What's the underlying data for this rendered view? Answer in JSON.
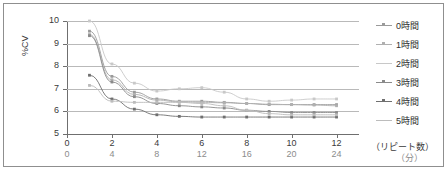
{
  "axes": {
    "ylabel": "%CV",
    "yticks": [
      "10",
      "9",
      "8",
      "7",
      "6",
      "5"
    ],
    "xticks_top": [
      "0",
      "2",
      "4",
      "6",
      "8",
      "10",
      "12"
    ],
    "xticks_bottom": [
      "0",
      "4",
      "8",
      "12",
      "16",
      "20",
      "24"
    ],
    "xunit_top": "（リピート数）",
    "xunit_bottom": "（分）"
  },
  "legend": {
    "items": [
      {
        "label": "0時間",
        "color": "#9a9a9a",
        "marker": "square"
      },
      {
        "label": "1時間",
        "color": "#b0b0b0",
        "marker": "square"
      },
      {
        "label": "2時間",
        "color": "#c8c8c8",
        "marker": "none"
      },
      {
        "label": "3時間",
        "color": "#8a8a8a",
        "marker": "square"
      },
      {
        "label": "4時間",
        "color": "#6f6f6f",
        "marker": "square"
      },
      {
        "label": "5時間",
        "color": "#bcbcbc",
        "marker": "none"
      }
    ]
  },
  "chart_data": {
    "type": "line",
    "title": "",
    "xlabel": "（リピート数）",
    "ylabel": "%CV",
    "xlim": [
      0,
      13
    ],
    "ylim": [
      5,
      10
    ],
    "grid": true,
    "legend_position": "right",
    "x": [
      1,
      2,
      3,
      4,
      5,
      6,
      7,
      8,
      9,
      10,
      11,
      12
    ],
    "x_minutes": [
      2,
      4,
      6,
      8,
      10,
      12,
      14,
      16,
      18,
      20,
      22,
      24
    ],
    "series": [
      {
        "name": "0時間",
        "color": "#9a9a9a",
        "values": [
          9.55,
          7.55,
          6.85,
          6.55,
          6.45,
          6.45,
          6.4,
          6.35,
          6.3,
          6.3,
          6.3,
          6.3
        ]
      },
      {
        "name": "1時間",
        "color": "#b0b0b0",
        "values": [
          9.4,
          7.4,
          6.75,
          6.5,
          6.42,
          6.4,
          6.38,
          6.35,
          6.32,
          6.3,
          6.28,
          6.25
        ]
      },
      {
        "name": "2時間",
        "color": "#c8c8c8",
        "values": [
          10.0,
          8.1,
          7.25,
          6.9,
          7.0,
          7.05,
          6.85,
          6.55,
          6.45,
          6.5,
          6.55,
          6.55
        ]
      },
      {
        "name": "3時間",
        "color": "#8a8a8a",
        "values": [
          9.35,
          7.3,
          6.65,
          6.35,
          6.25,
          6.2,
          6.15,
          6.05,
          6.0,
          5.95,
          5.95,
          5.95
        ]
      },
      {
        "name": "4時間",
        "color": "#6f6f6f",
        "values": [
          7.6,
          6.55,
          6.1,
          5.85,
          5.78,
          5.75,
          5.75,
          5.75,
          5.75,
          5.75,
          5.75,
          5.75
        ]
      },
      {
        "name": "5時間",
        "color": "#bcbcbc",
        "values": [
          7.15,
          6.45,
          6.4,
          6.4,
          6.4,
          6.35,
          6.25,
          6.05,
          5.9,
          5.85,
          5.85,
          5.85
        ]
      }
    ]
  }
}
